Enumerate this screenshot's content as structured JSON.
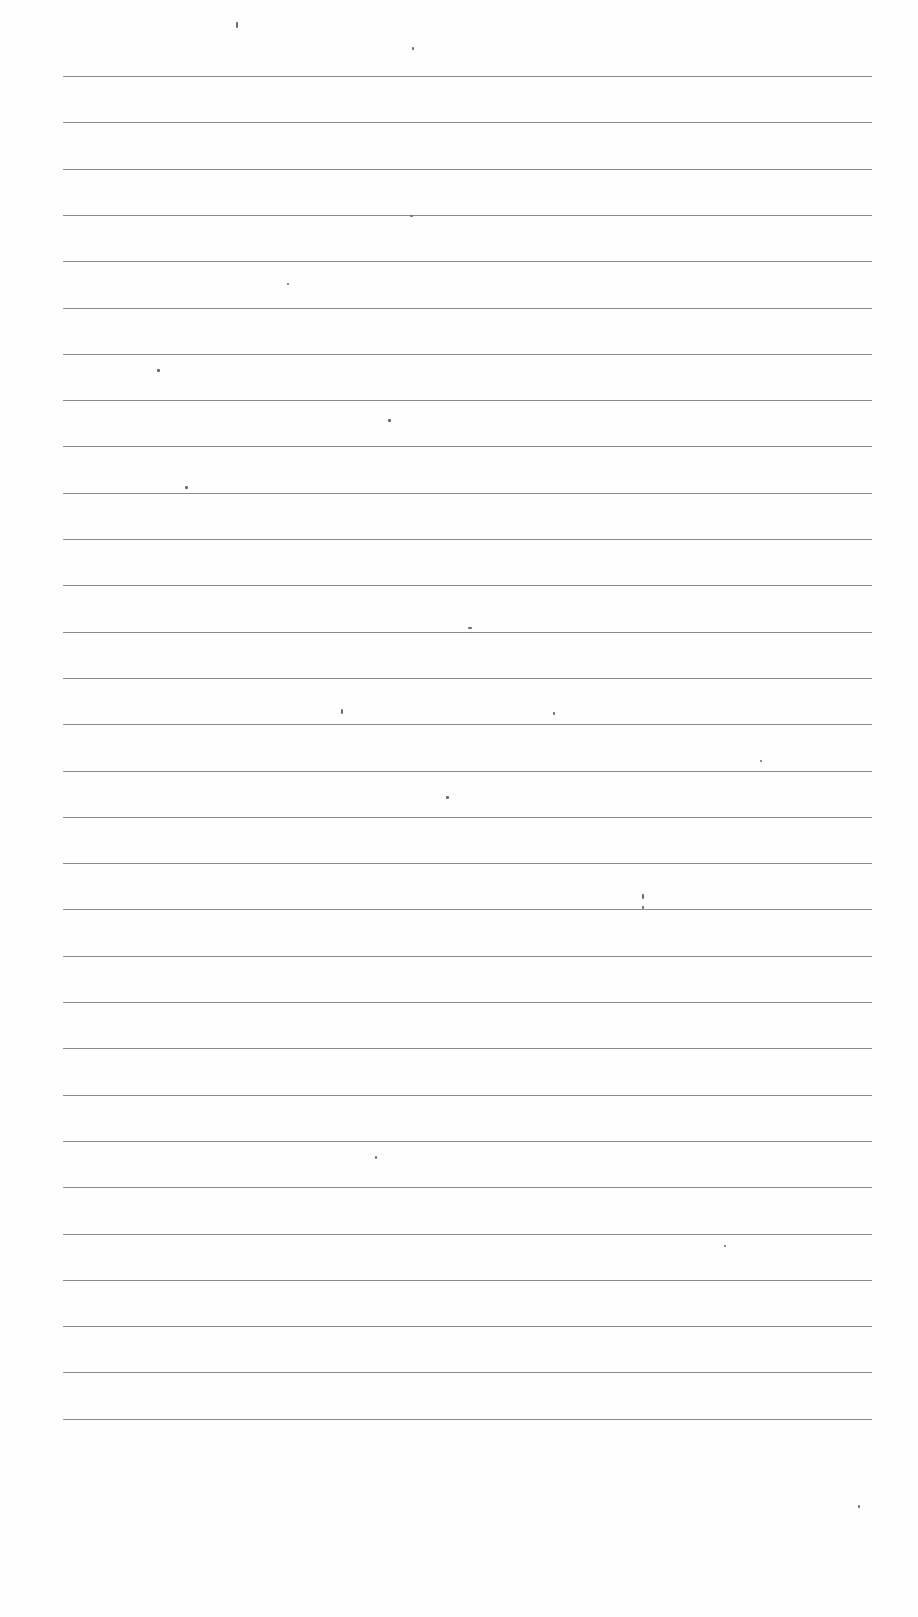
{
  "page": {
    "type": "ruled-sheet",
    "background_color": "#fefefe",
    "rule_color": "#8c8c8c",
    "rule_count": 30,
    "rule_left": 63,
    "rule_width": 809,
    "first_rule_y": 76,
    "rule_spacing": 46.3,
    "text_content": ""
  },
  "specks": [
    {
      "x": 236,
      "y": 22,
      "w": 2,
      "h": 6
    },
    {
      "x": 412,
      "y": 47,
      "w": 2,
      "h": 3
    },
    {
      "x": 410,
      "y": 215,
      "w": 3,
      "h": 2
    },
    {
      "x": 287,
      "y": 283,
      "w": 2,
      "h": 2
    },
    {
      "x": 157,
      "y": 369,
      "w": 3,
      "h": 3
    },
    {
      "x": 388,
      "y": 419,
      "w": 3,
      "h": 3
    },
    {
      "x": 185,
      "y": 486,
      "w": 3,
      "h": 3
    },
    {
      "x": 468,
      "y": 627,
      "w": 4,
      "h": 2
    },
    {
      "x": 341,
      "y": 709,
      "w": 2,
      "h": 5
    },
    {
      "x": 553,
      "y": 712,
      "w": 2,
      "h": 3
    },
    {
      "x": 446,
      "y": 796,
      "w": 3,
      "h": 3
    },
    {
      "x": 642,
      "y": 894,
      "w": 2,
      "h": 5
    },
    {
      "x": 642,
      "y": 906,
      "w": 2,
      "h": 3
    },
    {
      "x": 375,
      "y": 1156,
      "w": 2,
      "h": 3
    },
    {
      "x": 724,
      "y": 1245,
      "w": 2,
      "h": 2
    },
    {
      "x": 760,
      "y": 760,
      "w": 2,
      "h": 2
    },
    {
      "x": 858,
      "y": 1505,
      "w": 2,
      "h": 3
    }
  ]
}
